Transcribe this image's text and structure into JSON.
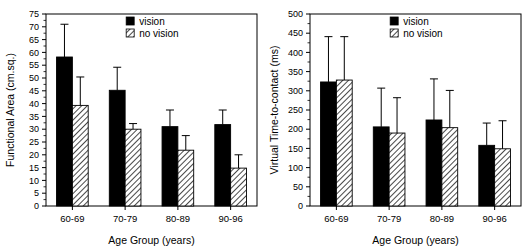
{
  "figure": {
    "background": "#ffffff",
    "panels": [
      "left",
      "right"
    ]
  },
  "legend": {
    "vision_label": "vision",
    "no_vision_label": "no vision",
    "vision_color": "#000000",
    "no_vision_color": "#ffffff",
    "no_vision_pattern": "diagonal-hatch"
  },
  "left_panel": {
    "ylabel": "Functional Area (cm.sq.)",
    "xlabel": "Age Group (years)",
    "yticks": [
      "0",
      "5",
      "10",
      "15",
      "20",
      "25",
      "30",
      "35",
      "40",
      "45",
      "50",
      "55",
      "60",
      "65",
      "70",
      "75"
    ],
    "xticks": [
      "60-69",
      "70-79",
      "80-89",
      "90-96"
    ]
  },
  "right_panel": {
    "ylabel": "Virtual Time-to-contact (ms)",
    "xlabel": "Age Group (years)",
    "yticks": [
      "0",
      "50",
      "100",
      "150",
      "200",
      "250",
      "300",
      "350",
      "400",
      "450",
      "500"
    ],
    "xticks": [
      "60-69",
      "70-79",
      "80-89",
      "90-96"
    ]
  },
  "chart_data": [
    {
      "type": "bar",
      "title": "",
      "panel": "left",
      "xlabel": "Age Group (years)",
      "ylabel": "Functional Area (cm.sq.)",
      "categories": [
        "60-69",
        "70-79",
        "80-89",
        "90-96"
      ],
      "ylim": [
        0,
        75
      ],
      "ytick_step": 5,
      "grid": false,
      "legend_position": "top-center",
      "error_bars": "upper-only",
      "series": [
        {
          "name": "vision",
          "fill": "#000000",
          "pattern": "solid",
          "values": [
            58.2,
            45.2,
            31.0,
            31.8
          ],
          "error_upper": [
            71.0,
            54.2,
            37.5,
            37.5
          ]
        },
        {
          "name": "no vision",
          "fill": "#ffffff",
          "pattern": "diagonal-hatch",
          "values": [
            39.3,
            30.0,
            21.8,
            14.8
          ],
          "error_upper": [
            50.4,
            32.2,
            27.5,
            20.0
          ]
        }
      ]
    },
    {
      "type": "bar",
      "title": "",
      "panel": "right",
      "xlabel": "Age Group (years)",
      "ylabel": "Virtual Time-to-contact (ms)",
      "categories": [
        "60-69",
        "70-79",
        "80-89",
        "90-96"
      ],
      "ylim": [
        0,
        500
      ],
      "ytick_step": 50,
      "grid": false,
      "legend_position": "top-center",
      "error_bars": "upper-only",
      "series": [
        {
          "name": "vision",
          "fill": "#000000",
          "pattern": "solid",
          "values": [
            323,
            206,
            224,
            158
          ],
          "error_upper": [
            441,
            307,
            331,
            216
          ]
        },
        {
          "name": "no vision",
          "fill": "#ffffff",
          "pattern": "diagonal-hatch",
          "values": [
            328,
            190,
            204,
            149
          ],
          "error_upper": [
            441,
            282,
            301,
            222
          ]
        }
      ]
    }
  ]
}
